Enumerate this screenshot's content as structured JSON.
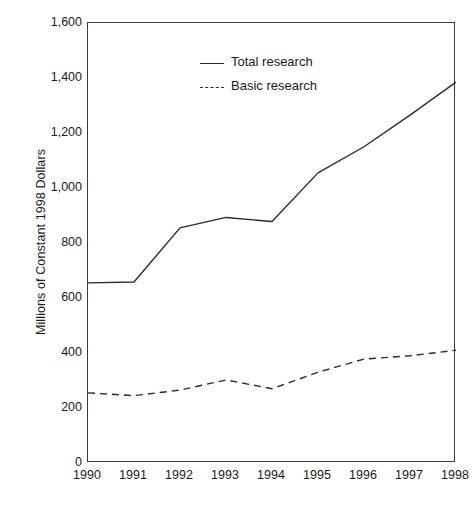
{
  "chart_data": {
    "type": "line",
    "title": "",
    "subtitle": "",
    "xlabel": "",
    "ylabel": "Millions of Constant 1998 Dollars",
    "categories": [
      "1990",
      "1991",
      "1992",
      "1993",
      "1994",
      "1995",
      "1996",
      "1997",
      "1998"
    ],
    "x": [
      1990,
      1991,
      1992,
      1993,
      1994,
      1995,
      1996,
      1997,
      1998
    ],
    "series": [
      {
        "name": "Total research",
        "style": "solid",
        "color": "#2b2b2b",
        "values": [
          655,
          658,
          855,
          893,
          878,
          1055,
          1150,
          1265,
          1385
        ]
      },
      {
        "name": "Basic research",
        "style": "dashed",
        "color": "#2b2b2b",
        "values": [
          255,
          245,
          265,
          302,
          270,
          330,
          378,
          390,
          410
        ]
      }
    ],
    "ylim": [
      0,
      1600
    ],
    "xlim": [
      1990,
      1998
    ],
    "y_ticks": [
      0,
      200,
      400,
      600,
      800,
      1000,
      1200,
      1400,
      1600
    ],
    "y_tick_labels": [
      "0",
      "200",
      "400",
      "600",
      "800",
      "1,000",
      "1,200",
      "1,400",
      "1,600"
    ],
    "x_ticks": [
      1990,
      1991,
      1992,
      1993,
      1994,
      1995,
      1996,
      1997,
      1998
    ],
    "x_tick_labels": [
      "1990",
      "1991",
      "1992",
      "1993",
      "1994",
      "1995",
      "1996",
      "1997",
      "1998"
    ],
    "grid": false,
    "legend_position": "top-left",
    "legend": [
      {
        "label": "Total research",
        "style": "solid"
      },
      {
        "label": "Basic research",
        "style": "dashed"
      }
    ]
  },
  "axes": {
    "y_title": "Millions of Constant 1998 Dollars"
  },
  "legend": {
    "items": [
      {
        "label": "Total research"
      },
      {
        "label": "Basic research"
      }
    ]
  },
  "colors": {
    "line": "#2b2b2b",
    "axis": "#3b3b3b",
    "background": "#ffffff",
    "text": "#1a1a1a"
  }
}
